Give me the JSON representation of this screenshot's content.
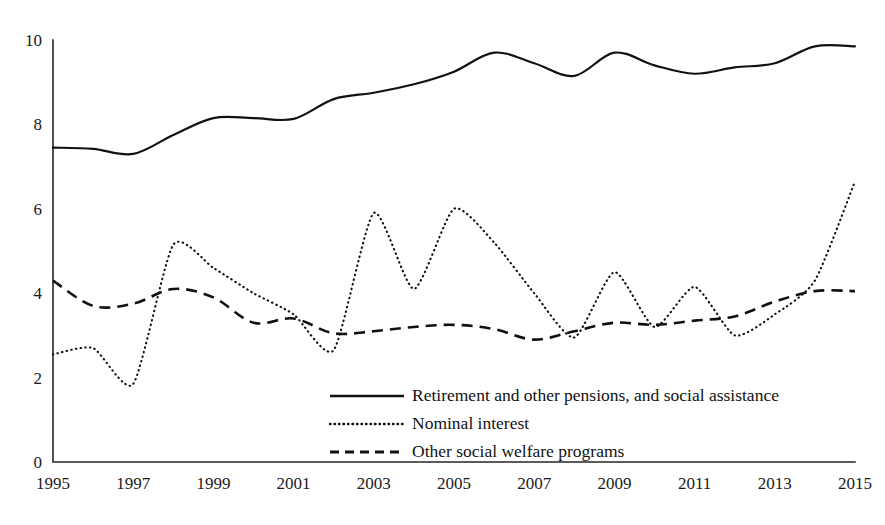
{
  "chart_data": {
    "type": "line",
    "title": "",
    "subtitle": "",
    "xlabel": "",
    "ylabel": "",
    "xlim": [
      1995,
      2015
    ],
    "ylim": [
      0,
      10
    ],
    "grid": false,
    "legend_position": "bottom-center",
    "x_tick_labels": [
      "1995",
      "1997",
      "1999",
      "2001",
      "2003",
      "2005",
      "2007",
      "2009",
      "2011",
      "2013",
      "2015"
    ],
    "x_ticks": [
      1995,
      1997,
      1999,
      2001,
      2003,
      2005,
      2007,
      2009,
      2011,
      2013,
      2015
    ],
    "y_tick_labels": [
      "0",
      "2",
      "4",
      "6",
      "8",
      "10"
    ],
    "y_ticks": [
      0,
      2,
      4,
      6,
      8,
      10
    ],
    "x": [
      1995,
      1996,
      1997,
      1998,
      1999,
      2000,
      2001,
      2002,
      2003,
      2004,
      2005,
      2006,
      2007,
      2008,
      2009,
      2010,
      2011,
      2012,
      2013,
      2014,
      2015
    ],
    "series": [
      {
        "name": "Retirement and other pensions, and social assistance",
        "style": "solid",
        "color": "#111111",
        "values": [
          7.45,
          7.42,
          7.3,
          7.75,
          8.15,
          8.15,
          8.13,
          8.6,
          8.75,
          8.95,
          9.25,
          9.7,
          9.45,
          9.15,
          9.7,
          9.4,
          9.2,
          9.35,
          9.45,
          9.85,
          9.85
        ]
      },
      {
        "name": "Nominal interest",
        "style": "dotted",
        "color": "#111111",
        "values": [
          2.55,
          2.7,
          1.85,
          5.15,
          4.6,
          4.0,
          3.5,
          2.65,
          5.9,
          4.1,
          6.0,
          5.2,
          4.0,
          2.95,
          4.5,
          3.2,
          4.15,
          3.0,
          3.5,
          4.3,
          6.65
        ]
      },
      {
        "name": "Other social welfare programs",
        "style": "dashed",
        "color": "#111111",
        "values": [
          4.3,
          3.7,
          3.75,
          4.1,
          3.9,
          3.3,
          3.4,
          3.05,
          3.1,
          3.2,
          3.25,
          3.15,
          2.9,
          3.1,
          3.3,
          3.25,
          3.35,
          3.45,
          3.8,
          4.05,
          4.05
        ]
      }
    ]
  },
  "legend": {
    "entries": [
      {
        "label": "Retirement and other pensions, and social assistance",
        "style": "solid"
      },
      {
        "label": "Nominal interest",
        "style": "dotted"
      },
      {
        "label": "Other social welfare programs",
        "style": "dashed"
      }
    ]
  }
}
